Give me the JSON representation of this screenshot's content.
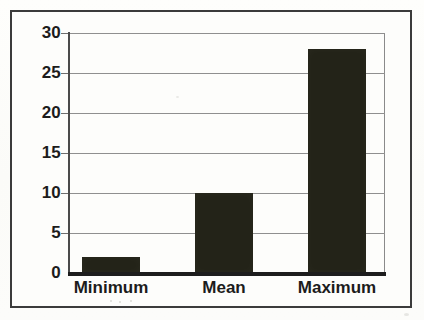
{
  "chart_data": {
    "type": "bar",
    "title": "",
    "subtitle": "",
    "xlabel": "",
    "ylabel": "",
    "categories": [
      "Minimum",
      "Mean",
      "Maximum"
    ],
    "values": [
      2,
      10,
      28
    ],
    "series": [
      {
        "name": "",
        "values": [
          2,
          10,
          28
        ]
      }
    ],
    "ylim": [
      0,
      30
    ],
    "yticks": [
      0,
      5,
      10,
      15,
      20,
      25,
      30
    ],
    "ytick_labels": [
      "0",
      "5",
      "10",
      "15",
      "20",
      "25",
      "30"
    ],
    "grid": "horizontal",
    "legend": "none",
    "annotations": [],
    "colors": {
      "bar_fill": "#232318",
      "gridline": "#8f8f8f",
      "axis": "#1d1d1d",
      "frame": "#3b3b3b",
      "background": "#fdfdfb",
      "text": "#1c1c1c"
    }
  }
}
